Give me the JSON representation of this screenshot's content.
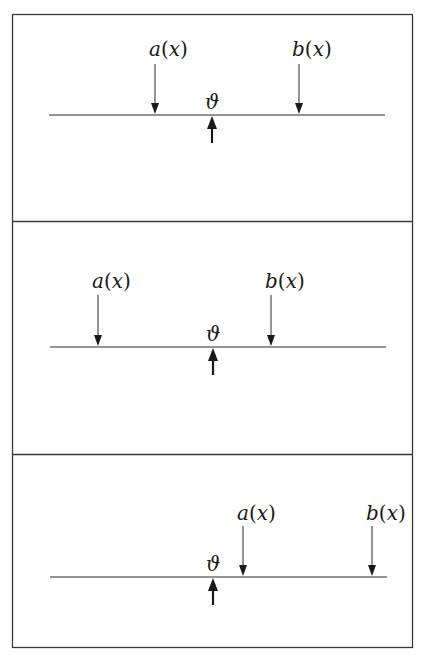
{
  "figure": {
    "labels": {
      "a": "a",
      "b": "b",
      "arg": "x",
      "theta": "ϑ",
      "open_paren": "(",
      "close_paren": ")"
    },
    "panels": [
      {
        "id": "panel-1",
        "description": "theta between a(x) and b(x)",
        "line": {
          "y": 115,
          "x1": 49,
          "x2": 385
        },
        "a_x": 155,
        "b_x": 299,
        "theta_x": 212,
        "label_y": 57
      },
      {
        "id": "panel-2",
        "description": "theta between a(x) and b(x), a further left",
        "line": {
          "y": 347,
          "x1": 50,
          "x2": 386
        },
        "a_x": 98,
        "b_x": 271,
        "theta_x": 213,
        "label_y": 290
      },
      {
        "id": "panel-3",
        "description": "theta left of both a(x) and b(x)",
        "line": {
          "y": 577,
          "x1": 50,
          "x2": 387
        },
        "a_x": 243,
        "b_x": 372,
        "theta_x": 213,
        "label_y": 523
      }
    ],
    "colors": {
      "ink": "#1a1a1a",
      "frame": "#3a3a3a",
      "background": "#ffffff"
    }
  }
}
